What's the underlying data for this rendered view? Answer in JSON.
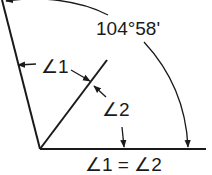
{
  "diagram": {
    "labels": {
      "total_angle": "104°58'",
      "angle1": "∠1",
      "angle2": "∠2",
      "equality": "∠1 = ∠2"
    },
    "colors": {
      "line": "#1a1a1a",
      "background": "#ffffff"
    },
    "geometry": {
      "vertex": [
        40,
        149
      ],
      "baseline_end": [
        206,
        149
      ],
      "left_arm_end": [
        2,
        0
      ],
      "bisector_end": [
        107,
        60
      ]
    }
  }
}
